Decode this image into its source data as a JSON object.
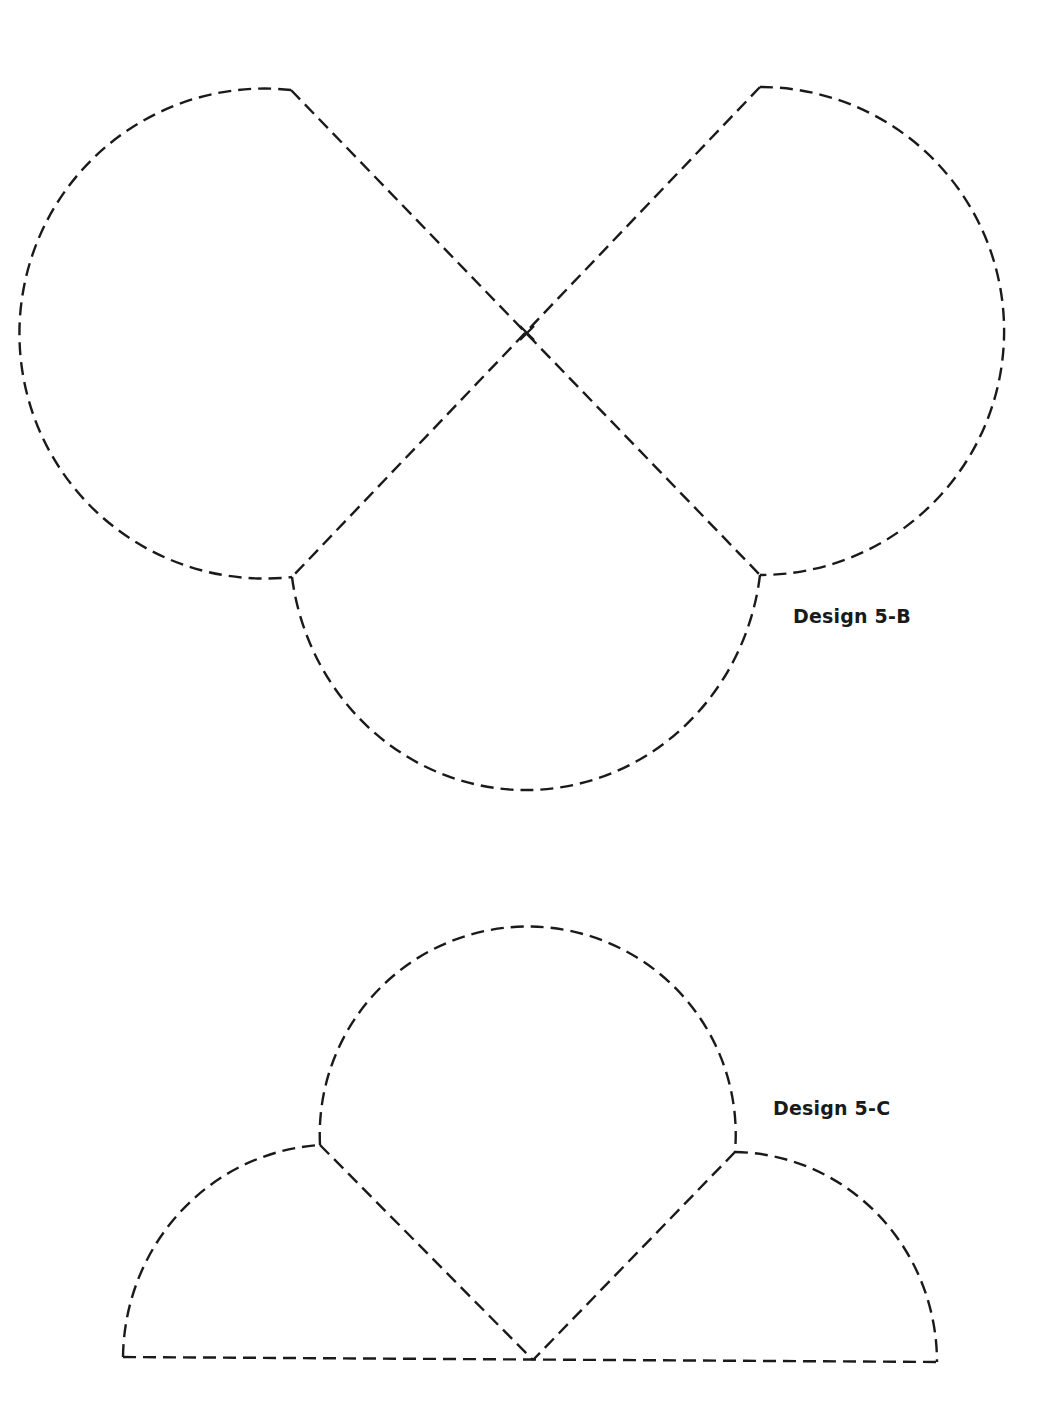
{
  "page": {
    "background": "#ffffff",
    "ink_color": "#1a1a1a"
  },
  "designs": [
    {
      "id": "5-B",
      "label": "Design 5-B",
      "description": "Three circular segments (left, right, bottom) joined by two crossing dashed straight lines forming an X",
      "points": {
        "top_left_tip": [
          291,
          90
        ],
        "top_right_tip": [
          760,
          87
        ],
        "crossing": [
          527,
          333
        ],
        "bottom_left_junction": [
          292,
          577
        ],
        "bottom_right_junction": [
          760,
          575
        ],
        "bottom_arc_low": [
          525,
          822
        ],
        "left_extreme": [
          55,
          330
        ],
        "right_extreme": [
          996,
          325
        ]
      }
    },
    {
      "id": "5-C",
      "label": "Design 5-C",
      "description": "Large central arc between two smaller side arcs, with two dashed lines meeting in a V at the baseline",
      "points": {
        "top_arc_peak": [
          527,
          947
        ],
        "left_junction": [
          320,
          1145
        ],
        "right_junction": [
          735,
          1152
        ],
        "bottom_vertex": [
          533,
          1360
        ],
        "baseline_left": [
          123,
          1357
        ],
        "baseline_right": [
          937,
          1362
        ]
      }
    }
  ],
  "line_style": {
    "type": "dashed",
    "stroke_width": 2.4,
    "dash": [
      13,
      7
    ]
  }
}
